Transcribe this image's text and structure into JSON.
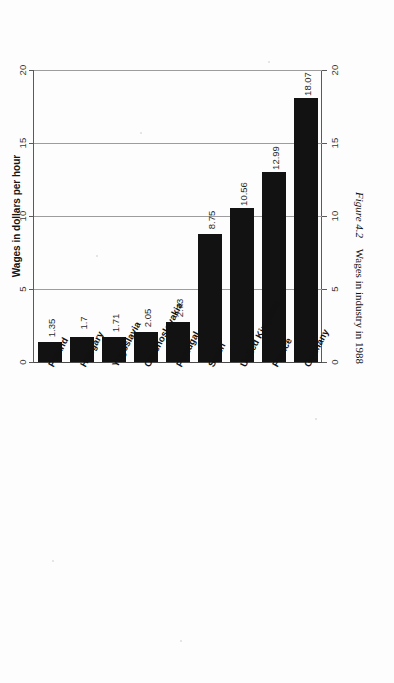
{
  "figure": {
    "caption_number": "Figure 4.2",
    "caption_text": "Wages in industry in 1988"
  },
  "axis": {
    "value_axis_title": "Wages in dollars per hour",
    "tick_labels": [
      "0",
      "5",
      "10",
      "15",
      "20"
    ]
  },
  "chart_data": {
    "type": "bar",
    "orientation": "horizontal",
    "title": "Wages in industry in 1988",
    "xlabel": "Wages in dollars per hour",
    "ylabel": "",
    "xlim": [
      0,
      20
    ],
    "ticks": [
      0,
      5,
      10,
      15,
      20
    ],
    "grid": true,
    "legend": "none",
    "categories": [
      "Germany",
      "France",
      "United Kingdom",
      "Spain",
      "Portugal",
      "Czechoslovakia",
      "Yugoslavia",
      "Hungary",
      "Poland"
    ],
    "values": [
      18.07,
      12.99,
      10.56,
      8.75,
      2.73,
      2.05,
      1.71,
      1.7,
      1.35
    ],
    "value_labels": [
      "18.07",
      "12.99",
      "10.56",
      "8.75",
      "2.73",
      "2.05",
      "1.71",
      "1.7",
      "1.35"
    ],
    "bar_color": "#121212"
  }
}
